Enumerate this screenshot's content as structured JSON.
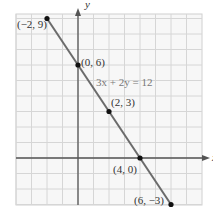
{
  "chart_data": {
    "type": "line",
    "title": "",
    "equation": "3x + 2y = 12",
    "xlabel": "x",
    "ylabel": "y",
    "xlim": [
      -4,
      8
    ],
    "ylim": [
      -3,
      9
    ],
    "grid": true,
    "tick_labels_shown": false,
    "series": [
      {
        "name": "3x + 2y = 12",
        "x": [
          -2,
          0,
          2,
          4,
          6
        ],
        "y": [
          9,
          6,
          3,
          0,
          -3
        ]
      }
    ],
    "points": [
      {
        "x": -2,
        "y": 9,
        "label": "(−2, 9)"
      },
      {
        "x": 0,
        "y": 6,
        "label": "(0, 6)"
      },
      {
        "x": 2,
        "y": 3,
        "label": "(2, 3)"
      },
      {
        "x": 4,
        "y": 0,
        "label": "(4, 0)"
      },
      {
        "x": 6,
        "y": -3,
        "label": "(6, −3)"
      }
    ],
    "annotations": [
      "3x + 2y = 12"
    ]
  },
  "axes": {
    "x_label": "x",
    "y_label": "y"
  },
  "labels": {
    "p1": "(−2, 9)",
    "p2": "(0, 6)",
    "p3": "(2, 3)",
    "p4": "(4, 0)",
    "p5": "(6, −3)",
    "equation": "3x + 2y = 12"
  },
  "colors": {
    "line": "#6b6b6b",
    "points": "#111111",
    "grid": "#d6d6d6",
    "axes": "#555555"
  }
}
